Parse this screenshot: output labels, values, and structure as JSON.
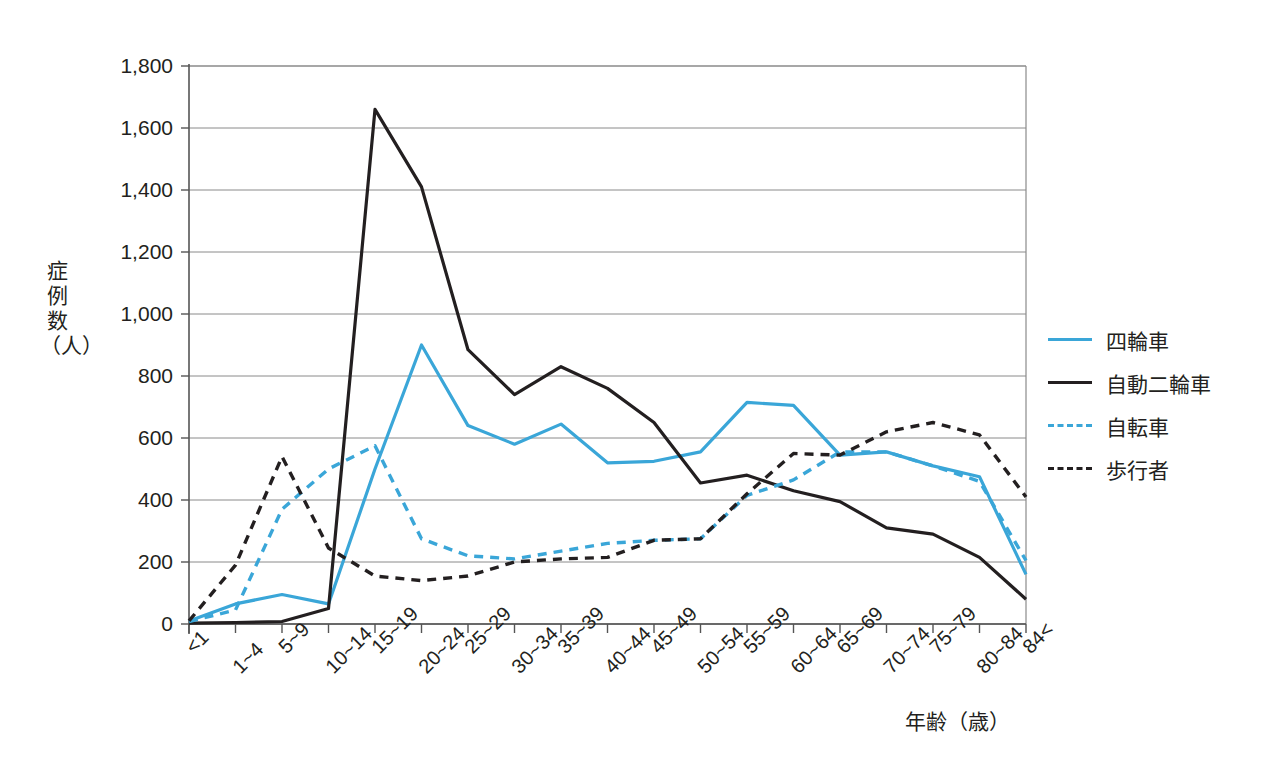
{
  "chart_data": {
    "type": "line",
    "title": "",
    "xlabel": "年齢（歳）",
    "ylabel": "症例数（人）",
    "ylim": [
      0,
      1800
    ],
    "ytick_step": 200,
    "grid": true,
    "legend_position": "right",
    "categories": [
      "<1",
      "1~4",
      "5~9",
      "10~14",
      "15~19",
      "20~24",
      "25~29",
      "30~34",
      "35~39",
      "40~44",
      "45~49",
      "50~54",
      "55~59",
      "60~64",
      "65~69",
      "70~74",
      "75~79",
      "80~84",
      "84<"
    ],
    "ytick_labels": [
      "0",
      "200",
      "400",
      "600",
      "800",
      "1,000",
      "1,200",
      "1,400",
      "1,600",
      "1,800"
    ],
    "series": [
      {
        "name": "四輪車",
        "color": "#3aa6d8",
        "style": "solid",
        "values": [
          10,
          65,
          95,
          65,
          500,
          900,
          640,
          580,
          645,
          520,
          525,
          555,
          715,
          705,
          545,
          555,
          510,
          475,
          160
        ]
      },
      {
        "name": "自動二輪車",
        "color": "#231f20",
        "style": "solid",
        "values": [
          3,
          5,
          8,
          50,
          1660,
          1410,
          885,
          740,
          830,
          760,
          650,
          455,
          480,
          430,
          395,
          310,
          290,
          215,
          80
        ]
      },
      {
        "name": "自転車",
        "color": "#3aa6d8",
        "style": "dashed",
        "values": [
          8,
          45,
          370,
          500,
          575,
          275,
          220,
          210,
          235,
          260,
          270,
          275,
          415,
          465,
          555,
          555,
          510,
          460,
          205
        ]
      },
      {
        "name": "歩行者",
        "color": "#231f20",
        "style": "dashed",
        "values": [
          10,
          190,
          540,
          245,
          155,
          140,
          155,
          200,
          210,
          215,
          270,
          275,
          420,
          550,
          545,
          620,
          650,
          610,
          410
        ]
      }
    ]
  },
  "axis": {
    "y_title_chars": [
      "症",
      "例",
      "数",
      "（人）"
    ],
    "x_title": "年齢（歳）"
  },
  "legend": {
    "items": [
      {
        "label": "四輪車"
      },
      {
        "label": "自動二輪車"
      },
      {
        "label": "自転車"
      },
      {
        "label": "歩行者"
      }
    ]
  }
}
